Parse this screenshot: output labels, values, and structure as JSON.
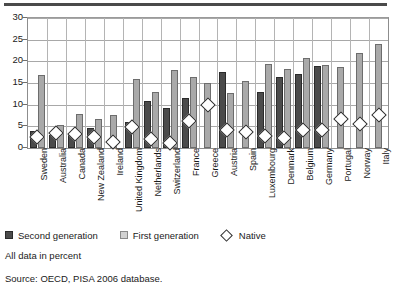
{
  "chart_data": {
    "type": "bar",
    "title": "",
    "xlabel": "",
    "ylabel": "",
    "ylim": [
      0,
      30
    ],
    "yticks": [
      0,
      5,
      10,
      15,
      20,
      25,
      30
    ],
    "grid": true,
    "legend_position": "below-plot",
    "categories": [
      "Sweden",
      "Australia",
      "Canada",
      "New Zealand",
      "Ireland",
      "United Kingdom",
      "Netherlands",
      "Switzerland",
      "France",
      "Greece",
      "Austria",
      "Spain",
      "Luxembourg",
      "Denmark",
      "Belgium",
      "Germany",
      "Portugal",
      "Norway",
      "Italy"
    ],
    "series": [
      {
        "name": "Second generation",
        "type": "bar",
        "color": "#4b4b4b",
        "values": [
          4.0,
          3.0,
          3.0,
          4.6,
          null,
          6.1,
          10.9,
          9.2,
          11.6,
          null,
          17.5,
          null,
          12.9,
          16.3,
          17.1,
          18.9,
          null,
          null,
          null
        ]
      },
      {
        "name": "First generation",
        "type": "bar",
        "color": "#a9a9a9",
        "values": [
          16.9,
          5.4,
          7.9,
          6.7,
          7.7,
          16.0,
          12.9,
          17.9,
          16.5,
          15.0,
          12.6,
          15.4,
          19.3,
          18.3,
          20.8,
          19.2,
          18.6,
          21.9,
          23.9
        ]
      },
      {
        "name": "Native",
        "type": "scatter",
        "marker": "diamond",
        "color": "#ffffff",
        "values": [
          3.5,
          4.4,
          4.3,
          3.6,
          2.4,
          5.8,
          3.2,
          2.3,
          7.3,
          10.9,
          5.3,
          4.7,
          3.9,
          3.3,
          5.2,
          5.3,
          7.7,
          6.5,
          8.6
        ]
      }
    ],
    "annotations": {
      "note": "All data in percent",
      "source": "Source: OECD, PISA 2006 database."
    }
  },
  "legend": {
    "items": [
      {
        "label": "Second generation",
        "marker": "filled-dark-square"
      },
      {
        "label": "First generation",
        "marker": "light-square"
      },
      {
        "label": "Native",
        "marker": "open-diamond"
      }
    ]
  },
  "footer": {
    "note": "All data in percent",
    "source": "Source: OECD, PISA 2006 database."
  }
}
